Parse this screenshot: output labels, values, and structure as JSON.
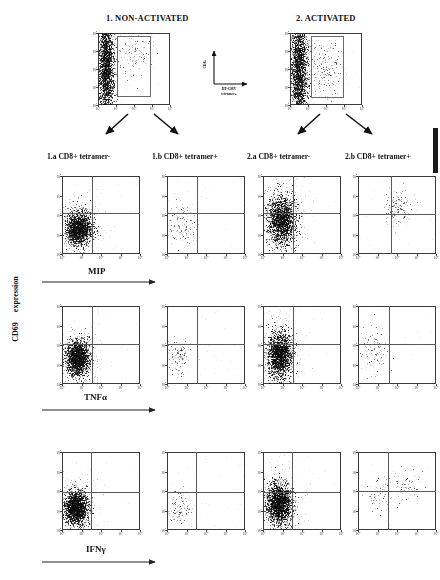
{
  "figure": {
    "top_groups": [
      {
        "id": "g1",
        "title": "1. NON-ACTIVATED"
      },
      {
        "id": "g2",
        "title": "2. ACTIVATED"
      }
    ],
    "center_axis": {
      "y_label": "CD8+",
      "x_label_line1": "HT-CMV",
      "x_label_line2": "tetramer+"
    },
    "y_axis_label_line1": "CD69",
    "y_axis_label_line2": "expression",
    "column_labels": [
      "1.a CD8+ tetramer-",
      "1.b CD8+ tetramer+",
      "2.a CD8+ tetramer-",
      "2.b CD8+ tetramer+"
    ],
    "row_labels": [
      "MIP",
      "TNFα",
      "IFNγ"
    ],
    "tick_labels": [
      "10",
      "10",
      "10",
      "10",
      "10"
    ],
    "tick_exponents": [
      "0",
      "1",
      "2",
      "3",
      "4"
    ],
    "colors": {
      "ink": "#111111",
      "frame": "#3a3a3a",
      "quadrant": "#5a5a5a",
      "gate": "#6a6a6a",
      "dots": "#0a0a0a"
    }
  },
  "chart_data": {
    "type": "scatter",
    "xlabel": "cytokine (MIP / TNFα / IFNγ)",
    "ylabel": "CD69 expression",
    "xlim": [
      0,
      4
    ],
    "ylim": [
      0,
      4
    ],
    "axis_scale": "log10",
    "grid": false,
    "legend": "none",
    "top_panels": [
      {
        "name": "1. NON-ACTIVATED",
        "xlabel": "HT-CMV tetramer+",
        "ylabel": "CD8+",
        "gate": {
          "x0": 1.05,
          "y0": 0.55,
          "x1": 2.85,
          "y1": 3.85
        },
        "clusters": [
          {
            "cx": 0.45,
            "cy": 2.1,
            "sx": 0.22,
            "sy": 1.45,
            "n": 2600,
            "density": "high"
          },
          {
            "cx": 2.0,
            "cy": 2.9,
            "sx": 0.52,
            "sy": 0.62,
            "n": 190,
            "density": "low"
          }
        ]
      },
      {
        "name": "2. ACTIVATED",
        "xlabel": "HT-CMV tetramer+",
        "ylabel": "CD8+",
        "gate": {
          "x0": 1.15,
          "y0": 0.5,
          "x1": 2.9,
          "y1": 3.85
        },
        "clusters": [
          {
            "cx": 0.5,
            "cy": 2.0,
            "sx": 0.23,
            "sy": 1.5,
            "n": 2600,
            "density": "high"
          },
          {
            "cx": 1.95,
            "cy": 2.0,
            "sx": 0.45,
            "sy": 0.85,
            "n": 320,
            "density": "low"
          }
        ]
      }
    ],
    "grid_panels": [
      {
        "row": "MIP",
        "column": "1.a CD8+ tetramer-",
        "quadrant_x": 1.55,
        "quadrant_y": 2.1,
        "clusters": [
          {
            "cx": 0.85,
            "cy": 1.35,
            "sx": 0.33,
            "sy": 0.42,
            "n": 2200,
            "density": "high"
          }
        ]
      },
      {
        "row": "MIP",
        "column": "1.b CD8+ tetramer+",
        "quadrant_x": 1.55,
        "quadrant_y": 2.1,
        "clusters": [
          {
            "cx": 0.75,
            "cy": 1.5,
            "sx": 0.35,
            "sy": 0.55,
            "n": 210,
            "density": "low"
          }
        ]
      },
      {
        "row": "MIP",
        "column": "2.a CD8+ tetramer-",
        "quadrant_x": 1.55,
        "quadrant_y": 2.1,
        "clusters": [
          {
            "cx": 0.95,
            "cy": 1.75,
            "sx": 0.36,
            "sy": 0.62,
            "n": 2300,
            "density": "high"
          }
        ]
      },
      {
        "row": "MIP",
        "column": "2.b CD8+ tetramer+",
        "quadrant_x": 1.7,
        "quadrant_y": 2.05,
        "clusters": [
          {
            "cx": 2.05,
            "cy": 2.35,
            "sx": 0.34,
            "sy": 0.42,
            "n": 230,
            "density": "low"
          }
        ]
      },
      {
        "row": "TNFα",
        "column": "1.a CD8+ tetramer-",
        "quadrant_x": 1.55,
        "quadrant_y": 2.05,
        "clusters": [
          {
            "cx": 0.8,
            "cy": 1.35,
            "sx": 0.3,
            "sy": 0.45,
            "n": 2200,
            "density": "high"
          }
        ]
      },
      {
        "row": "TNFα",
        "column": "1.b CD8+ tetramer+",
        "quadrant_x": 1.55,
        "quadrant_y": 2.05,
        "clusters": [
          {
            "cx": 0.62,
            "cy": 1.45,
            "sx": 0.3,
            "sy": 0.45,
            "n": 190,
            "density": "low"
          }
        ]
      },
      {
        "row": "TNFα",
        "column": "2.a CD8+ tetramer-",
        "quadrant_x": 1.55,
        "quadrant_y": 2.05,
        "clusters": [
          {
            "cx": 0.85,
            "cy": 1.5,
            "sx": 0.32,
            "sy": 0.6,
            "n": 2300,
            "density": "high"
          }
        ]
      },
      {
        "row": "TNFα",
        "column": "2.b CD8+ tetramer+",
        "quadrant_x": 1.6,
        "quadrant_y": 2.05,
        "clusters": [
          {
            "cx": 0.85,
            "cy": 1.6,
            "sx": 0.4,
            "sy": 0.62,
            "n": 160,
            "density": "low"
          }
        ]
      },
      {
        "row": "IFNγ",
        "column": "1.a CD8+ tetramer-",
        "quadrant_x": 1.5,
        "quadrant_y": 1.95,
        "clusters": [
          {
            "cx": 0.72,
            "cy": 1.15,
            "sx": 0.3,
            "sy": 0.42,
            "n": 2400,
            "density": "high"
          }
        ]
      },
      {
        "row": "IFNγ",
        "column": "1.b CD8+ tetramer+",
        "quadrant_x": 1.5,
        "quadrant_y": 1.95,
        "clusters": [
          {
            "cx": 0.62,
            "cy": 1.1,
            "sx": 0.28,
            "sy": 0.4,
            "n": 170,
            "density": "low"
          }
        ]
      },
      {
        "row": "IFNγ",
        "column": "2.a CD8+ tetramer-",
        "quadrant_x": 1.5,
        "quadrant_y": 1.95,
        "clusters": [
          {
            "cx": 0.8,
            "cy": 1.35,
            "sx": 0.33,
            "sy": 0.55,
            "n": 2400,
            "density": "high"
          }
        ]
      },
      {
        "row": "IFNγ",
        "column": "2.b CD8+ tetramer+",
        "quadrant_x": 1.55,
        "quadrant_y": 2.0,
        "clusters": [
          {
            "cx": 1.15,
            "cy": 1.7,
            "sx": 0.3,
            "sy": 0.45,
            "n": 120,
            "density": "low"
          },
          {
            "cx": 2.35,
            "cy": 2.35,
            "sx": 0.45,
            "sy": 0.4,
            "n": 130,
            "density": "low"
          }
        ]
      }
    ]
  }
}
